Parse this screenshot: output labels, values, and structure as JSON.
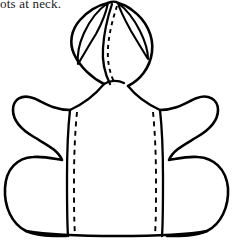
{
  "page": {
    "background_color": "#ffffff",
    "ink_color": "#000000",
    "width": 234,
    "height": 244
  },
  "caption": {
    "text_fragment": "ots at neck.",
    "note": "partially cropped line of body text at top-left"
  },
  "figure": {
    "kind": "line-drawing",
    "parts": [
      {
        "name": "hood-peak",
        "label": "hood peak"
      },
      {
        "name": "hood-left-facing",
        "label": "left hood facing"
      },
      {
        "name": "hood-right-facing",
        "label": "right hood facing"
      },
      {
        "name": "hood-center-seam",
        "label": "hood center front stitching"
      },
      {
        "name": "shoulder-left",
        "label": "left shoulder line"
      },
      {
        "name": "shoulder-right",
        "label": "right shoulder line"
      },
      {
        "name": "sleeve-left",
        "label": "left sleeve / cape wing"
      },
      {
        "name": "sleeve-right",
        "label": "right sleeve / cape wing"
      },
      {
        "name": "body-panel",
        "label": "center body panel"
      },
      {
        "name": "body-seam-left",
        "label": "left body seam"
      },
      {
        "name": "body-seam-right",
        "label": "right body seam"
      },
      {
        "name": "stitch-line-left",
        "label": "left topstitching"
      },
      {
        "name": "stitch-line-right",
        "label": "right topstitching"
      },
      {
        "name": "hem",
        "label": "bottom hem"
      }
    ]
  }
}
